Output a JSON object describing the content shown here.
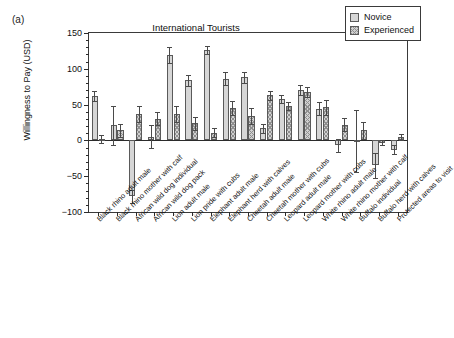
{
  "panel": {
    "letter": "(a)"
  },
  "chart_data": {
    "type": "bar",
    "title": "International Tourists",
    "xlabel": "",
    "ylabel": "Willingness to Pay (USD)",
    "ylim": [
      -100,
      150
    ],
    "yticks": [
      -100,
      -50,
      0,
      50,
      100,
      150
    ],
    "ytick_labels": [
      "-100",
      "-50",
      "0",
      "50",
      "100",
      "150"
    ],
    "grid": false,
    "legend_position": "top-right",
    "categories": [
      "Black rhino adult male",
      "Black rhino mother with calf",
      "African wild dog individual",
      "African wild dog pack",
      "Lion adult male",
      "Lion pride with cubs",
      "Elephant adult male",
      "Elephant herd with calves",
      "Cheetah adult male",
      "Cheetah mother with cubs",
      "Leopard adult male",
      "Leopard mother with cubs",
      "White rhino adult male",
      "White rhino mother with calf",
      "Buffalo individual",
      "Buffalo herd with calves",
      "Protected areas to visit"
    ],
    "series": [
      {
        "name": "Novice",
        "color": "#d6d6d6",
        "pattern": "solid",
        "values": [
          62,
          21,
          -78,
          5,
          119,
          84,
          126,
          86,
          88,
          17,
          58,
          71,
          44,
          -7,
          -1,
          -35,
          -13
        ],
        "errors": [
          7,
          27,
          9,
          16,
          11,
          8,
          6,
          9,
          8,
          6,
          6,
          7,
          9,
          9,
          43,
          18,
          6
        ]
      },
      {
        "name": "Experienced",
        "color": "#d0d0d0",
        "pattern": "crosshatch",
        "values": [
          2,
          14,
          37,
          30,
          37,
          24,
          11,
          45,
          34,
          63,
          48,
          67,
          46,
          22,
          14,
          -3,
          5
        ],
        "errors": [
          5,
          9,
          11,
          9,
          11,
          9,
          6,
          10,
          11,
          6,
          5,
          7,
          10,
          9,
          12,
          4,
          4
        ]
      }
    ]
  },
  "legend": {
    "items": [
      {
        "label": "Novice",
        "swatch": "novice"
      },
      {
        "label": "Experienced",
        "swatch": "experienced"
      }
    ]
  }
}
